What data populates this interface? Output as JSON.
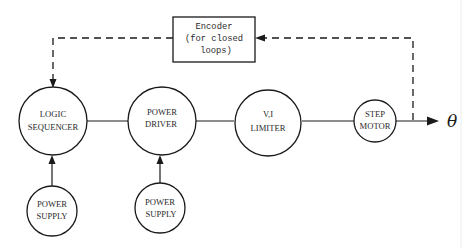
{
  "diagram": {
    "encoder": {
      "line1": "Encoder",
      "line2": "(for closed",
      "line3": "loops)"
    },
    "nodes": {
      "logic_sequencer": {
        "line1": "LOGIC",
        "line2": "SEQUENCER"
      },
      "power_driver": {
        "line1": "POWER",
        "line2": "DRIVER"
      },
      "vi_limiter": {
        "line1": "V,I",
        "line2": "LIMITER"
      },
      "step_motor": {
        "line1": "STEP",
        "line2": "MOTOR"
      },
      "power_supply_1": {
        "line1": "POWER",
        "line2": "SUPPLY"
      },
      "power_supply_2": {
        "line1": "POWER",
        "line2": "SUPPLY"
      }
    },
    "output_symbol": "θ",
    "connections": [
      {
        "from": "logic_sequencer",
        "to": "power_driver",
        "style": "solid"
      },
      {
        "from": "power_driver",
        "to": "vi_limiter",
        "style": "solid"
      },
      {
        "from": "vi_limiter",
        "to": "step_motor",
        "style": "solid"
      },
      {
        "from": "step_motor",
        "to": "output_theta",
        "style": "solid-arrow"
      },
      {
        "from": "power_supply_1",
        "to": "logic_sequencer",
        "style": "solid-arrow"
      },
      {
        "from": "power_supply_2",
        "to": "power_driver",
        "style": "solid-arrow"
      },
      {
        "from": "step_motor_output",
        "to": "encoder",
        "style": "dashed-arrow"
      },
      {
        "from": "encoder",
        "to": "logic_sequencer",
        "style": "dashed-arrow"
      }
    ],
    "colors": {
      "ink": "#1a1a1a",
      "background": "#ffffff"
    }
  }
}
